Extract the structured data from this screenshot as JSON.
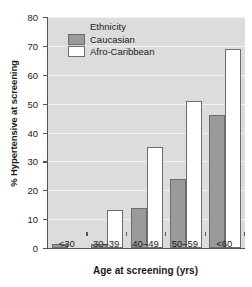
{
  "chart_data": {
    "type": "bar",
    "title": "",
    "xlabel": "Age at screening (yrs)",
    "ylabel": "% Hypertensive at screening",
    "categories": [
      "<30",
      "30–39",
      "40–49",
      "50–59",
      "<60"
    ],
    "series": [
      {
        "name": "Caucasian",
        "color": "#9a9a9a",
        "values": [
          1.5,
          1.5,
          14,
          24,
          46
        ]
      },
      {
        "name": "Afro-Caribbean",
        "color": "#ffffff",
        "values": [
          0,
          13,
          35,
          51,
          69
        ]
      }
    ],
    "ylim": [
      0,
      80
    ],
    "ytick_values": [
      0,
      10,
      20,
      30,
      40,
      50,
      60,
      70,
      80
    ],
    "ytick_labels": [
      "0",
      "10",
      "20",
      "30",
      "40",
      "50",
      "60",
      "70",
      "80"
    ],
    "grid": true,
    "grid_axis": "y",
    "legend": {
      "title": "Ethnicity",
      "position": "upper-left-inside",
      "entries": [
        {
          "label": "Caucasian",
          "swatch": "#9a9a9a"
        },
        {
          "label": "Afro-Caribbean",
          "swatch": "#ffffff"
        }
      ]
    },
    "plot_background": "#dcdcdc",
    "gridline_color": "#f2f2f2",
    "axis_color": "#555555",
    "bar_edge_color": "#6d6d6d"
  }
}
